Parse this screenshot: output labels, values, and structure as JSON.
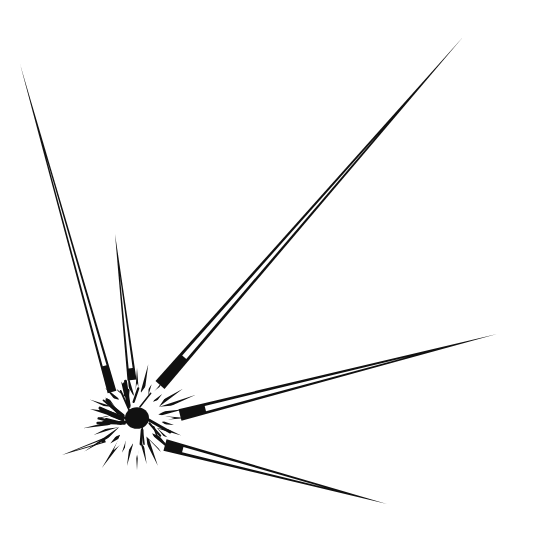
{
  "illustration": {
    "subject": "spiky burst with long radiating spines (sea urchin / starburst ink drawing)",
    "background": "#ffffff",
    "ink": "#111111",
    "core": {
      "cx": 137,
      "cy": 418,
      "r_inner": 12,
      "r_burst": 62
    },
    "spines": [
      {
        "name": "spine-far-left",
        "base": [
          112,
          392
        ],
        "tip": [
          20,
          64
        ],
        "width": 9
      },
      {
        "name": "spine-upper-left",
        "base": [
          132,
          380
        ],
        "tip": [
          115,
          234
        ],
        "width": 9
      },
      {
        "name": "spine-upper-right",
        "base": [
          160,
          385
        ],
        "tip": [
          463,
          37
        ],
        "width": 12
      },
      {
        "name": "spine-right",
        "base": [
          180,
          415
        ],
        "tip": [
          497,
          334
        ],
        "width": 12
      },
      {
        "name": "spine-lower-right",
        "base": [
          165,
          445
        ],
        "tip": [
          387,
          504
        ],
        "width": 12
      },
      {
        "name": "spine-left-short",
        "base": [
          105,
          440
        ],
        "tip": [
          62,
          455
        ],
        "width": 5
      }
    ]
  }
}
